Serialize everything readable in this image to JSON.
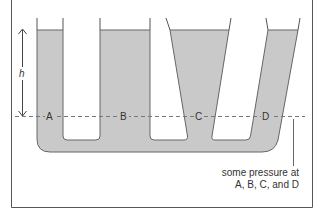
{
  "diagram": {
    "height_label": "h",
    "points": [
      "A",
      "B",
      "C",
      "D"
    ],
    "caption_line1": "some pressure at",
    "caption_line2": "A, B, C, and D",
    "colors": {
      "liquid": "#c9c9c9",
      "wall": "#555555",
      "frame": "#555555",
      "dashed_line": "#777777",
      "text": "#333333"
    }
  }
}
